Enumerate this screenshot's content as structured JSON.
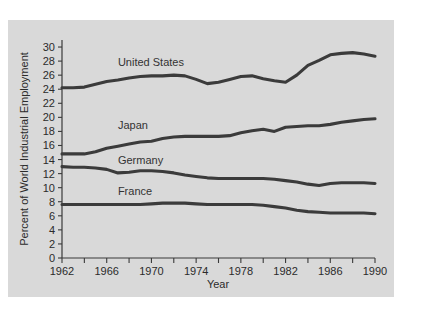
{
  "figure": {
    "background_color": "#ffffff",
    "panel_color": "#d9d9d9",
    "line_color": "#3b3b3b",
    "text_color": "#2b2b2b"
  },
  "chart_data": {
    "type": "line",
    "title": "",
    "xlabel": "Year",
    "ylabel": "Percent of World Industrial Employment",
    "xlim": [
      1962,
      1990
    ],
    "ylim": [
      0,
      31
    ],
    "grid": false,
    "legend_position": "inline-annotations",
    "x_ticks_major": [
      1962,
      1966,
      1970,
      1974,
      1978,
      1982,
      1986,
      1990
    ],
    "x_ticks_minor": [
      1964,
      1968,
      1972,
      1976,
      1980,
      1984,
      1988
    ],
    "x_tick_labels": [
      "1962",
      "1966",
      "1970",
      "1974",
      "1978",
      "1982",
      "1986",
      "1990"
    ],
    "y_ticks": [
      0,
      2,
      4,
      6,
      8,
      10,
      12,
      14,
      16,
      18,
      20,
      22,
      24,
      26,
      28,
      30
    ],
    "y_tick_labels": [
      "0",
      "2",
      "4",
      "6",
      "8",
      "10",
      "12",
      "14",
      "16",
      "18",
      "20",
      "22",
      "24",
      "26",
      "28",
      "30"
    ],
    "x": [
      1962,
      1963,
      1964,
      1965,
      1966,
      1967,
      1968,
      1969,
      1970,
      1971,
      1972,
      1973,
      1974,
      1975,
      1976,
      1977,
      1978,
      1979,
      1980,
      1981,
      1982,
      1983,
      1984,
      1985,
      1986,
      1987,
      1988,
      1989,
      1990
    ],
    "series": [
      {
        "name": "United States",
        "label": "United States",
        "label_x": 1967.0,
        "label_y": 27.3,
        "values": [
          24.2,
          24.2,
          24.3,
          24.7,
          25.1,
          25.3,
          25.6,
          25.8,
          25.9,
          25.9,
          26.0,
          25.9,
          25.4,
          24.8,
          25.0,
          25.4,
          25.8,
          25.9,
          25.5,
          25.2,
          25.0,
          26.0,
          27.4,
          28.1,
          28.9,
          29.1,
          29.2,
          29.0,
          28.7
        ]
      },
      {
        "name": "Japan",
        "label": "Japan",
        "label_x": 1967.0,
        "label_y": 18.3,
        "values": [
          14.8,
          14.8,
          14.8,
          15.1,
          15.6,
          15.9,
          16.2,
          16.5,
          16.6,
          17.0,
          17.2,
          17.3,
          17.3,
          17.3,
          17.3,
          17.4,
          17.8,
          18.1,
          18.3,
          18.0,
          18.6,
          18.7,
          18.8,
          18.8,
          19.0,
          19.3,
          19.5,
          19.7,
          19.8
        ]
      },
      {
        "name": "Germany",
        "label": "Germany",
        "label_x": 1967.0,
        "label_y": 13.4,
        "values": [
          13.0,
          12.9,
          12.9,
          12.8,
          12.6,
          12.1,
          12.2,
          12.4,
          12.4,
          12.3,
          12.1,
          11.8,
          11.6,
          11.4,
          11.3,
          11.3,
          11.3,
          11.3,
          11.3,
          11.2,
          11.0,
          10.8,
          10.5,
          10.3,
          10.6,
          10.7,
          10.7,
          10.7,
          10.6
        ]
      },
      {
        "name": "France",
        "label": "France",
        "label_x": 1967.0,
        "label_y": 8.9,
        "values": [
          7.6,
          7.6,
          7.6,
          7.6,
          7.6,
          7.6,
          7.6,
          7.6,
          7.7,
          7.8,
          7.8,
          7.8,
          7.7,
          7.6,
          7.6,
          7.6,
          7.6,
          7.6,
          7.5,
          7.3,
          7.1,
          6.8,
          6.6,
          6.5,
          6.4,
          6.4,
          6.4,
          6.4,
          6.3
        ]
      }
    ]
  }
}
